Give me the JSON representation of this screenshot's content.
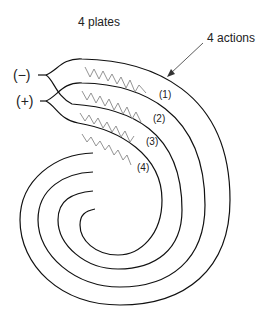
{
  "diagram": {
    "title": "4 plates",
    "arrow_label": "4 actions",
    "terminals": {
      "negative": "(−)",
      "positive": "(+)"
    },
    "action_labels": [
      "(1)",
      "(2)",
      "(3)",
      "(4)"
    ],
    "colors": {
      "line": "#111111",
      "zigzag": "#888888",
      "text": "#222222"
    }
  }
}
